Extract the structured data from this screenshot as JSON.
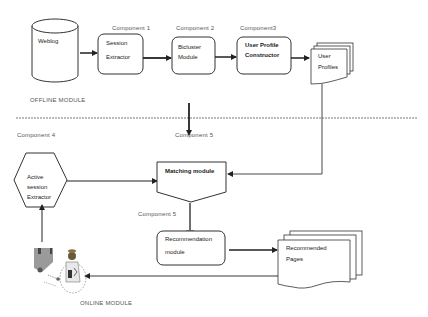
{
  "diagram": {
    "modules": {
      "offline": "OFFLINE MODULE",
      "online": "ONLINE MODULE"
    },
    "components": {
      "c1": "Component 1",
      "c2": "Component 2",
      "c3": "Component3",
      "c4": "Component 4",
      "c5a": "Component 5",
      "c5b": "Component 5"
    },
    "nodes": {
      "weblog": "Weblog",
      "session_extractor_1": "Session",
      "session_extractor_2": "Extractor",
      "bicluster_1": "Bicluster",
      "bicluster_2": "Module",
      "upc_1": "User Profile",
      "upc_2": "Constructor",
      "user_profiles_1": "User",
      "user_profiles_2": "Profiles",
      "active_1": "Active",
      "active_2": "session",
      "active_3": "Extractor",
      "matching": "Matching module",
      "recommendation_1": "Recommendation",
      "recommendation_2": "module",
      "recommended_1": "Recommended",
      "recommended_2": "Pages"
    },
    "colors": {
      "stroke": "#333333",
      "background": "#ffffff"
    }
  }
}
